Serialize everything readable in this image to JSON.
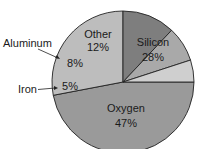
{
  "chart_data": {
    "type": "pie",
    "title": "",
    "slices": [
      {
        "label": "Oxygen",
        "value": 47,
        "display": "47%",
        "color": "#9a9a9a"
      },
      {
        "label": "Silicon",
        "value": 28,
        "display": "28%",
        "color": "#bdbdbd"
      },
      {
        "label": "Other",
        "value": 12,
        "display": "12%",
        "color": "#7e7e7e"
      },
      {
        "label": "Aluminum",
        "value": 8,
        "display": "8%",
        "color": "#a9a9a9"
      },
      {
        "label": "Iron",
        "value": 5,
        "display": "5%",
        "color": "#cfcfcf"
      }
    ],
    "external_labels": [
      "Aluminum",
      "Iron"
    ]
  }
}
